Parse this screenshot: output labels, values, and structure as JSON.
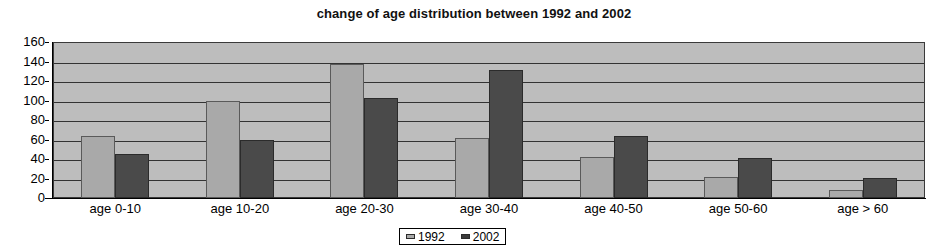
{
  "chart_data": {
    "type": "bar",
    "title": "change of age distribution between 1992 and 2002",
    "xlabel": "",
    "ylabel": "",
    "categories": [
      "age 0-10",
      "age 10-20",
      "age 20-30",
      "age 30-40",
      "age 40-50",
      "age 50-60",
      "age > 60"
    ],
    "series": [
      {
        "name": "1992",
        "color": "#a9a9a9",
        "values": [
          64,
          100,
          137,
          62,
          42,
          22,
          8
        ]
      },
      {
        "name": "2002",
        "color": "#3a3a3a",
        "values": [
          45,
          60,
          103,
          131,
          64,
          41,
          21
        ]
      }
    ],
    "ylim": [
      0,
      160
    ],
    "ytick_labels": [
      "160",
      "140",
      "120",
      "100",
      "80",
      "60",
      "40",
      "20",
      "0"
    ],
    "ytick_values": [
      160,
      140,
      120,
      100,
      80,
      60,
      40,
      20,
      0
    ],
    "grid": true,
    "grid_axis": "y",
    "legend_position": "bottom-center",
    "plot_background": "#bdbdbd"
  },
  "legend": {
    "entries": [
      {
        "label": "1992"
      },
      {
        "label": "2002"
      }
    ]
  }
}
